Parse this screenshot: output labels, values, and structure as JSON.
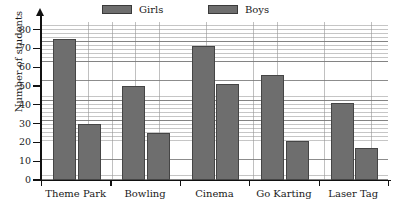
{
  "chart_data": {
    "type": "bar",
    "title": "",
    "xlabel": "",
    "ylabel": "Number of students",
    "categories": [
      "Theme Park",
      "Bowling",
      "Cinema",
      "Go Karting",
      "Laser Tag"
    ],
    "series": [
      {
        "name": "Girls",
        "values": [
          75,
          50,
          71,
          56,
          41
        ]
      },
      {
        "name": "Boys",
        "values": [
          30,
          25,
          51,
          21,
          17
        ]
      }
    ],
    "ylim": [
      0,
      84
    ],
    "yticks": [
      0,
      10,
      20,
      30,
      40,
      50,
      60,
      70,
      80
    ],
    "ytick_labels": [
      "0",
      "10",
      "20",
      "30",
      "40",
      "50",
      "60",
      "70",
      "80"
    ],
    "grid": true,
    "grid_minor_step": 2,
    "legend_position": "top",
    "bar_color": "#6e6e6e",
    "bar_edge_color": "#454545",
    "axis_color": "#111111",
    "grid_color": "#969696",
    "background_color": "#ffffff"
  },
  "legend": {
    "entries": [
      {
        "label": "Girls",
        "color": "#6e6e6e"
      },
      {
        "label": "Boys",
        "color": "#6e6e6e"
      }
    ]
  }
}
